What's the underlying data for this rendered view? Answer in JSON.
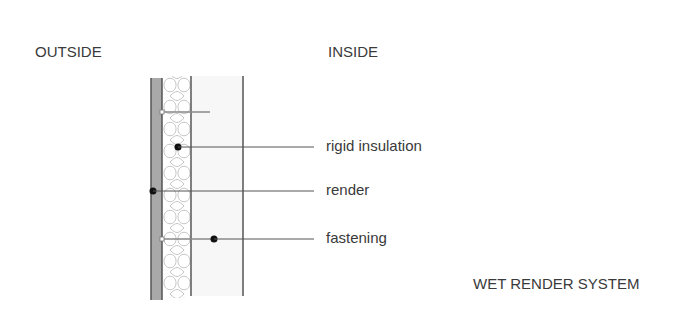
{
  "labels": {
    "outside": "OUTSIDE",
    "inside": "INSIDE",
    "title": "WET RENDER SYSTEM"
  },
  "callouts": [
    {
      "text": "rigid insulation",
      "target": "insulation"
    },
    {
      "text": "render",
      "target": "render layer"
    },
    {
      "text": "fastening",
      "target": "mechanical fixing"
    }
  ],
  "colors": {
    "render": "#a8a8a8",
    "lines": "#555555",
    "insulation_curls": "#bdbdbd",
    "background": "#ffffff"
  }
}
